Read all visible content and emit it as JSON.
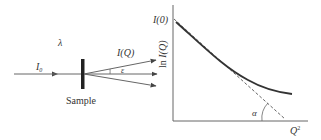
{
  "scattering": {
    "wavelength_label": "λ",
    "incident_label": "I₀",
    "incident_label_main": "I",
    "incident_label_sub": "0",
    "scattered_label": "I(Q)",
    "angle_label": "ε",
    "sample_label": "Sample"
  },
  "plot": {
    "y_intercept_label": "I(0)",
    "y_axis_label": "ln I(Q)",
    "x_axis_label": "Q²",
    "x_axis_label_main": "Q",
    "x_axis_label_sup": "2",
    "slope_angle_label": "α"
  },
  "colors": {
    "line": "#555555",
    "curve": "#333333",
    "sample": "#222222"
  }
}
